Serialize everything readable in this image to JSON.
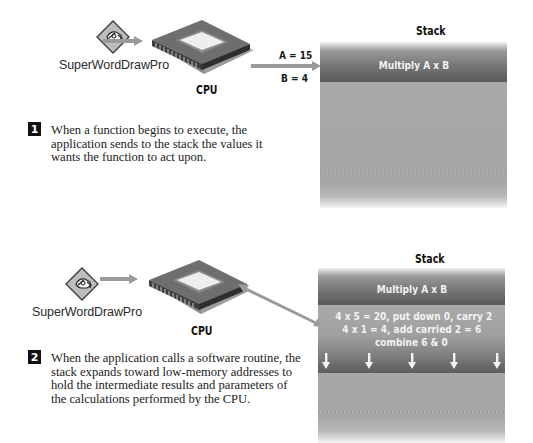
{
  "panels": [
    {
      "app_label": "SuperWordDrawPro",
      "cpu_label": "CPU",
      "values": [
        "A = 15",
        "B = 4"
      ],
      "stack_title": "Stack",
      "stack_top_label": "Multiply A x B",
      "step_number": "1",
      "step_text": "When a function begins to execute, the application sends to the stack the values it wants the function to act upon."
    },
    {
      "app_label": "SuperWordDrawPro",
      "cpu_label": "CPU",
      "stack_title": "Stack",
      "stack_top_label": "Multiply A x B",
      "operations": [
        "4 x 5 = 20, put down 0, carry 2",
        "4 x 1 = 4, add carried 2 = 6",
        "combine 6 & 0"
      ],
      "down_arrow_count": 5,
      "step_number": "2",
      "step_text": "When the application calls a software routine, the stack expands toward low-memory addresses to hold the intermediate results and parameters of the calculations performed by the CPU."
    }
  ],
  "icons": {
    "app": "pen-hand-diamond-icon",
    "cpu": "cpu-chip-icon",
    "arrow": "arrow-right-icon",
    "stack_arrow": "arrow-down-icon"
  },
  "colors": {
    "arrow": "#9a9a9a",
    "stack_body": "#a8a8a8",
    "stack_top_dark": "#5a5a5a",
    "stack_text": "#f2f2f2",
    "badge": "#111111"
  }
}
